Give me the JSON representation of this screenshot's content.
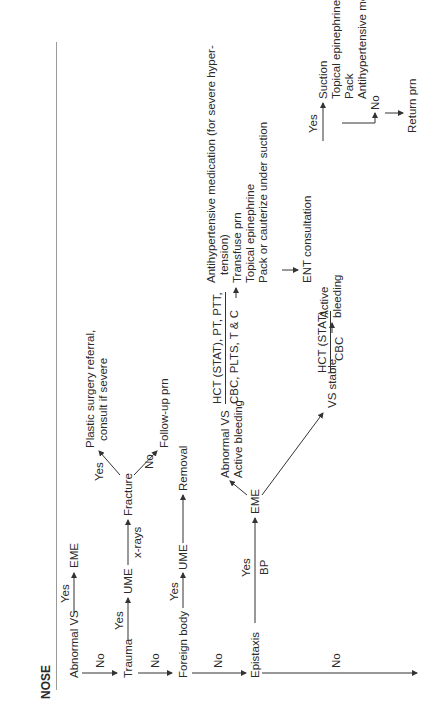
{
  "section": {
    "title": "NOSE"
  },
  "rows": [
    {
      "condition": "Abnormal VS",
      "yes_label": "Yes",
      "yes_result": "EME",
      "no_label": "No"
    },
    {
      "condition": "Trauma",
      "yes_label": "Yes",
      "yes_result": "UME",
      "step_label": "x-rays",
      "step_result": "Fracture",
      "fracture_yes_label": "Yes",
      "fracture_yes_result_line1": "Plastic surgery referral,",
      "fracture_yes_result_line2": "consult if severe",
      "fracture_no_label": "No",
      "fracture_no_result": "Follow-up prn",
      "no_label": "No"
    },
    {
      "condition": "Foreign body",
      "yes_label": "Yes",
      "yes_result": "UME",
      "step_result": "Removal",
      "no_label": "No"
    },
    {
      "condition": "Epistaxis",
      "yes_label": "Yes",
      "yes_sublabel": "BP",
      "yes_result": "EME",
      "branch_abnormal": {
        "line1": "Abnormal VS",
        "line2": "Active bleeding",
        "tests_line1": "HCT (STAT), PT, PTT,",
        "tests_line2": "CBC, PLTS, T & C",
        "actions": [
          "Antihypertensive medication (for severe hyper-",
          "tension)",
          "Transfuse prn",
          "Topical epinephrine",
          "Pack or cauterize under suction"
        ],
        "followup": "ENT consultation"
      },
      "branch_stable": {
        "label": "VS stable",
        "tests_line1": "HCT (STAT)",
        "tests_line2": "CBC",
        "decision_line1": "Active",
        "decision_line2": "bleeding",
        "yes_label": "Yes",
        "yes_actions": [
          "Suction",
          "Topical epinephrine",
          "Pack",
          "Antihypertensive medication, if indicated"
        ],
        "no_label": "No",
        "no_result": "Return prn"
      },
      "no_label": "No"
    }
  ]
}
